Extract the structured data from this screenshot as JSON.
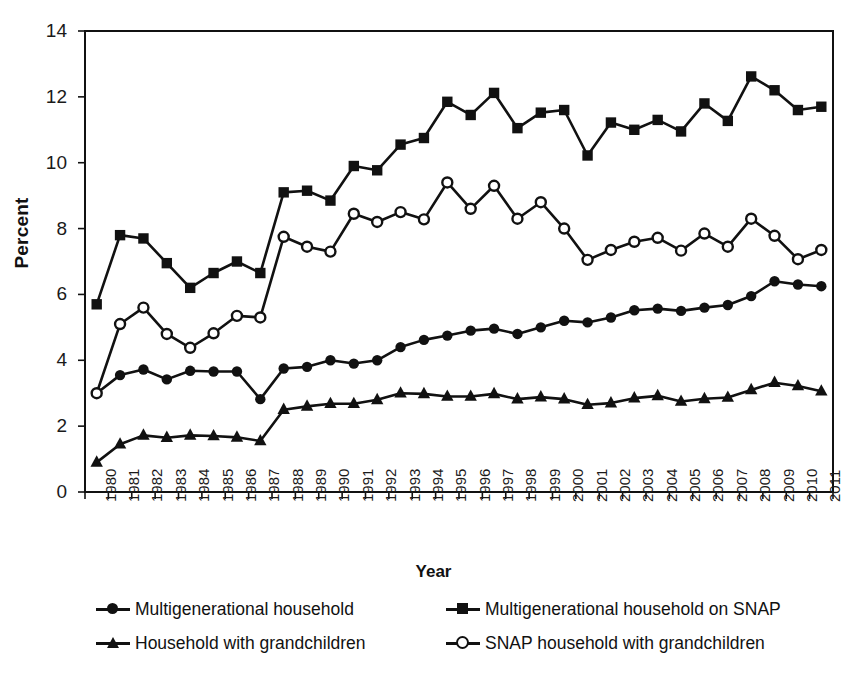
{
  "chart_data": {
    "type": "line",
    "title": "",
    "xlabel": "Year",
    "ylabel": "Percent",
    "ylim": [
      0,
      14
    ],
    "ytick_step": 2,
    "yticks": [
      "14",
      "12",
      "10",
      "8",
      "6",
      "4",
      "2",
      "0"
    ],
    "grid": false,
    "legend_position": "bottom",
    "marker_colors": {
      "line": "#111111",
      "fill_open": "#ffffff"
    },
    "categories": [
      "1980",
      "1981",
      "1982",
      "1983",
      "1984",
      "1985",
      "1986",
      "1987",
      "1988",
      "1989",
      "1990",
      "1991",
      "1992",
      "1993",
      "1994",
      "1995",
      "1996",
      "1997",
      "1998",
      "1999",
      "2000",
      "2001",
      "2002",
      "2003",
      "2004",
      "2005",
      "2006",
      "2007",
      "2008",
      "2009",
      "2010",
      "2011"
    ],
    "series": [
      {
        "name": "Multigenerational household",
        "marker": "circle-filled",
        "values": [
          3.0,
          3.55,
          3.72,
          3.42,
          3.68,
          3.66,
          3.66,
          2.82,
          3.75,
          3.8,
          4.0,
          3.9,
          4.0,
          4.4,
          4.62,
          4.75,
          4.9,
          4.96,
          4.8,
          5.0,
          5.2,
          5.15,
          5.3,
          5.52,
          5.57,
          5.5,
          5.6,
          5.68,
          5.95,
          6.4,
          6.3,
          6.25
        ]
      },
      {
        "name": "Multigenerational household on SNAP",
        "marker": "square-filled",
        "values": [
          5.7,
          7.8,
          7.7,
          6.95,
          6.2,
          6.65,
          7.0,
          6.65,
          9.1,
          9.15,
          8.85,
          9.9,
          9.77,
          10.55,
          10.75,
          11.85,
          11.45,
          12.12,
          11.05,
          11.52,
          11.6,
          10.22,
          11.22,
          11.0,
          11.3,
          10.95,
          11.8,
          11.27,
          12.62,
          12.2,
          11.6,
          11.7
        ]
      },
      {
        "name": "Household with grandchildren",
        "marker": "triangle-filled",
        "values": [
          0.9,
          1.45,
          1.72,
          1.65,
          1.72,
          1.7,
          1.66,
          1.55,
          2.5,
          2.6,
          2.68,
          2.68,
          2.8,
          3.0,
          2.98,
          2.9,
          2.9,
          2.98,
          2.82,
          2.88,
          2.82,
          2.65,
          2.7,
          2.85,
          2.92,
          2.75,
          2.83,
          2.87,
          3.1,
          3.32,
          3.22,
          3.06
        ]
      },
      {
        "name": "SNAP household with grandchildren",
        "marker": "circle-open",
        "values": [
          3.0,
          5.1,
          5.6,
          4.8,
          4.38,
          4.82,
          5.35,
          5.3,
          7.75,
          7.45,
          7.3,
          8.45,
          8.2,
          8.5,
          8.28,
          9.4,
          8.6,
          9.3,
          8.3,
          8.8,
          8.0,
          7.05,
          7.35,
          7.6,
          7.72,
          7.33,
          7.85,
          7.45,
          8.3,
          7.78,
          7.07,
          7.35
        ]
      }
    ]
  },
  "legend": {
    "entries": [
      {
        "label": "Multigenerational household",
        "marker": "circle-filled"
      },
      {
        "label": "Multigenerational household on SNAP",
        "marker": "square-filled"
      },
      {
        "label": "Household with grandchildren",
        "marker": "triangle-filled"
      },
      {
        "label": "SNAP household with grandchildren",
        "marker": "circle-open"
      }
    ]
  }
}
